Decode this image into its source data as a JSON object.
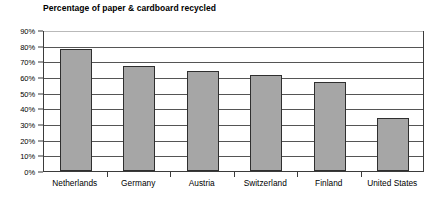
{
  "chart_data": {
    "type": "bar",
    "title": "Percentage of paper & cardboard recycled",
    "xlabel": "",
    "ylabel": "",
    "categories": [
      "Netherlands",
      "Germany",
      "Austria",
      "Switzerland",
      "Finland",
      "United States"
    ],
    "values": [
      78,
      67,
      64,
      61,
      57,
      34
    ],
    "ylim": [
      0,
      90
    ],
    "ytick_values": [
      0,
      10,
      20,
      30,
      40,
      50,
      60,
      70,
      80,
      90
    ],
    "ytick_labels": [
      "0%",
      "10%",
      "20%",
      "30%",
      "40%",
      "50%",
      "60%",
      "70%",
      "80%",
      "90%"
    ],
    "grid": true,
    "grid_axis": "y",
    "legend": false,
    "legend_position": "none",
    "bar_fill_color": "#a6a6a6",
    "bar_border_color": "#2f2f2f",
    "gridline_color": "#555555",
    "axis_color": "#3b3b3b",
    "background_color": "#ffffff",
    "text_color": "#000000"
  }
}
